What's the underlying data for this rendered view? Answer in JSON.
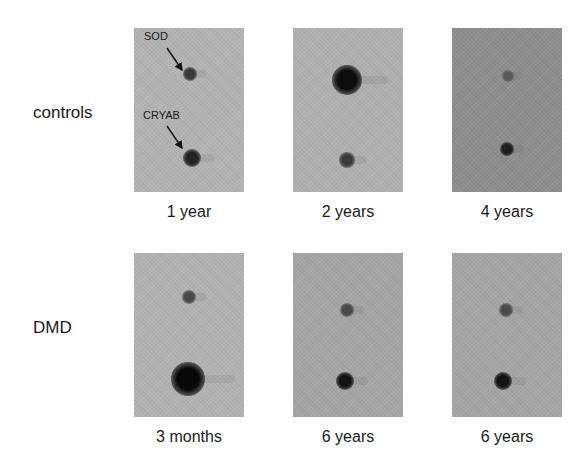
{
  "figure": {
    "rows": [
      {
        "label": "controls",
        "panels": [
          {
            "caption": "1 year",
            "bg": "#b3b3b3",
            "spots": [
              {
                "name": "sod-spot",
                "x": 56,
                "y": 46,
                "r": 7,
                "color": "#3a3a3a"
              },
              {
                "name": "cryab-spot",
                "x": 58,
                "y": 130,
                "r": 9,
                "color": "#222222"
              }
            ],
            "annotations": [
              {
                "text": "SOD"
              },
              {
                "text": "CRYAB"
              }
            ]
          },
          {
            "caption": "2 years",
            "bg": "#b0b0b0",
            "spots": [
              {
                "name": "sod-spot",
                "x": 54,
                "y": 52,
                "r": 15,
                "color": "#0d0d0d"
              },
              {
                "name": "cryab-spot",
                "x": 54,
                "y": 132,
                "r": 8,
                "color": "#3c3c3c"
              }
            ]
          },
          {
            "caption": "4 years",
            "bg": "#8e8e8e",
            "spots": [
              {
                "name": "sod-spot",
                "x": 56,
                "y": 48,
                "r": 6,
                "color": "#5a5a5a"
              },
              {
                "name": "cryab-spot",
                "x": 55,
                "y": 121,
                "r": 7,
                "color": "#1e1e1e"
              }
            ]
          }
        ]
      },
      {
        "label": "DMD",
        "panels": [
          {
            "caption": "3 months",
            "bg": "#b2b2b2",
            "spots": [
              {
                "name": "sod-spot",
                "x": 55,
                "y": 44,
                "r": 7,
                "color": "#474747"
              },
              {
                "name": "cryab-spot",
                "x": 54,
                "y": 126,
                "r": 17,
                "color": "#080808"
              }
            ]
          },
          {
            "caption": "6 years",
            "bg": "#a5a5a5",
            "spots": [
              {
                "name": "sod-spot",
                "x": 54,
                "y": 57,
                "r": 7,
                "color": "#4a4a4a"
              },
              {
                "name": "cryab-spot",
                "x": 52,
                "y": 128,
                "r": 9,
                "color": "#151515"
              }
            ]
          },
          {
            "caption": "6 years",
            "bg": "#a5a5a5",
            "spots": [
              {
                "name": "sod-spot",
                "x": 54,
                "y": 57,
                "r": 7,
                "color": "#4a4a4a"
              },
              {
                "name": "cryab-spot",
                "x": 51,
                "y": 128,
                "r": 9,
                "color": "#151515"
              }
            ]
          }
        ]
      }
    ]
  }
}
